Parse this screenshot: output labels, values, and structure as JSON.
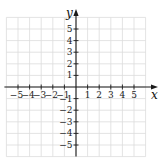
{
  "chart_data": {
    "type": "scatter",
    "title": "",
    "xlabel": "x",
    "ylabel": "y",
    "xlim": [
      -6,
      6
    ],
    "ylim": [
      -6,
      6
    ],
    "grid": true,
    "x_ticks": [
      -5,
      -4,
      -3,
      -2,
      -1,
      1,
      2,
      3,
      4,
      5
    ],
    "y_ticks": [
      5,
      4,
      3,
      2,
      1,
      -1,
      -2,
      -3,
      -4,
      -5
    ],
    "x_tick_labels": [
      "−5",
      "−4",
      "−3",
      "−2",
      "−1",
      "1",
      "2",
      "3",
      "4",
      "5"
    ],
    "y_tick_labels": [
      "5",
      "4",
      "3",
      "2",
      "1",
      "−1",
      "−2",
      "−3",
      "−4",
      "−5"
    ],
    "points": [],
    "legend": null
  },
  "colors": {
    "grid": "#dcdcdc",
    "axis": "#1a1a1a",
    "background": "#ffffff"
  }
}
